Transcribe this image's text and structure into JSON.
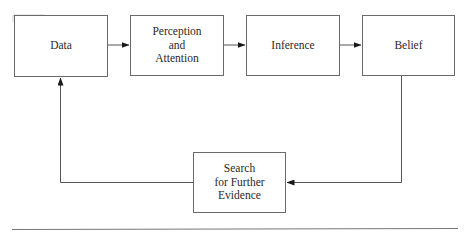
{
  "diagram": {
    "type": "flowchart",
    "nodes": [
      {
        "id": "data",
        "lines": [
          "Data"
        ]
      },
      {
        "id": "perception",
        "lines": [
          "Perception",
          "and",
          "Attention"
        ]
      },
      {
        "id": "inference",
        "lines": [
          "Inference"
        ]
      },
      {
        "id": "belief",
        "lines": [
          "Belief"
        ]
      },
      {
        "id": "search",
        "lines": [
          "Search",
          "for Further",
          "Evidence"
        ]
      }
    ],
    "edges": [
      {
        "from": "data",
        "to": "perception"
      },
      {
        "from": "perception",
        "to": "inference"
      },
      {
        "from": "inference",
        "to": "belief"
      },
      {
        "from": "belief",
        "to": "search"
      },
      {
        "from": "search",
        "to": "data"
      }
    ],
    "colors": {
      "stroke": "#6a6a6a",
      "arrow": "#1a1a1a",
      "text": "#2a2a2a",
      "background": "#ffffff"
    }
  }
}
